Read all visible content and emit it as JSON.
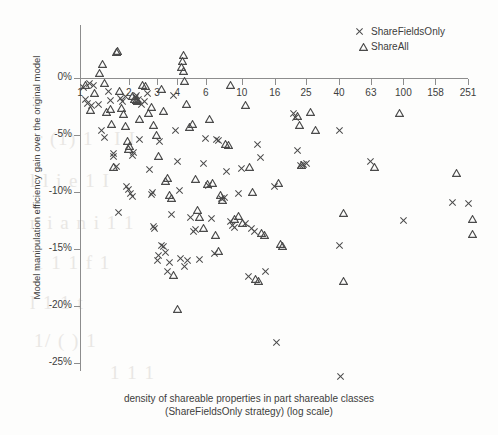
{
  "chart_data": {
    "type": "scatter",
    "title": "",
    "xlabel": "density of shareable properties in part shareable classes (ShareFieldsOnly strategy)  (log scale)",
    "ylabel": "Model manipulation efficiency gain over the original model",
    "xscale": "log",
    "xlim": [
      1,
      251
    ],
    "ylim": [
      -0.275,
      0.03
    ],
    "grid": false,
    "legend_position": "top-right",
    "xticks": [
      1,
      2,
      3,
      4,
      6,
      10,
      16,
      25,
      40,
      63,
      100,
      158,
      251
    ],
    "xtick_labels": [
      "1",
      "2",
      "3",
      "4",
      "6",
      "10",
      "16",
      "25",
      "40",
      "63",
      "100",
      "158",
      "251"
    ],
    "yticks": [
      0,
      -5,
      -10,
      -15,
      -20,
      -25
    ],
    "ytick_labels": [
      "0%",
      "-5%",
      "-10%",
      "-15%",
      "-20%",
      "-25%"
    ],
    "series": [
      {
        "name": "ShareFieldsOnly",
        "marker": "x",
        "color": "#4a4a4a",
        "points": [
          [
            1.05,
            -0.8
          ],
          [
            1.08,
            -1.9
          ],
          [
            1.12,
            -2.2
          ],
          [
            1.15,
            -0.5
          ],
          [
            1.18,
            -2.4
          ],
          [
            1.22,
            -0.7
          ],
          [
            1.3,
            -2.3
          ],
          [
            1.35,
            -4.6
          ],
          [
            1.42,
            -5.2
          ],
          [
            1.5,
            -1.2
          ],
          [
            1.55,
            -2.0
          ],
          [
            1.6,
            -6.6
          ],
          [
            1.62,
            -6.9
          ],
          [
            1.68,
            -7.8
          ],
          [
            1.72,
            -11.8
          ],
          [
            1.78,
            -1.8
          ],
          [
            1.82,
            -2.1
          ],
          [
            1.9,
            -1.6
          ],
          [
            1.95,
            -9.5
          ],
          [
            2.0,
            -9.8
          ],
          [
            2.05,
            -10.1
          ],
          [
            2.1,
            -10.4
          ],
          [
            2.12,
            -6.8
          ],
          [
            2.15,
            -6.5
          ],
          [
            2.2,
            -1.7
          ],
          [
            2.25,
            -1.5
          ],
          [
            2.3,
            -1.9
          ],
          [
            2.35,
            -5.4
          ],
          [
            2.4,
            -2.3
          ],
          [
            2.5,
            -2.1
          ],
          [
            2.6,
            -1.4
          ],
          [
            2.7,
            -8.0
          ],
          [
            2.75,
            -10.2
          ],
          [
            2.8,
            -10.0
          ],
          [
            2.85,
            -13.0
          ],
          [
            2.9,
            -13.2
          ],
          [
            3.0,
            -16.0
          ],
          [
            3.05,
            -15.6
          ],
          [
            3.1,
            -5.6
          ],
          [
            3.2,
            -14.7
          ],
          [
            3.3,
            -14.8
          ],
          [
            3.4,
            -15.3
          ],
          [
            3.5,
            -17.0
          ],
          [
            3.6,
            -16.2
          ],
          [
            3.7,
            -12.0
          ],
          [
            3.8,
            -1.5
          ],
          [
            3.9,
            -4.6
          ],
          [
            4.0,
            -7.3
          ],
          [
            4.1,
            -9.9
          ],
          [
            4.2,
            -15.8
          ],
          [
            4.4,
            -16.5
          ],
          [
            4.6,
            -16.0
          ],
          [
            4.8,
            -12.2
          ],
          [
            5.0,
            -13.5
          ],
          [
            5.2,
            -13.3
          ],
          [
            5.5,
            -15.9
          ],
          [
            5.8,
            -7.5
          ],
          [
            6.0,
            -5.3
          ],
          [
            6.2,
            -9.4
          ],
          [
            6.5,
            -12.3
          ],
          [
            6.8,
            -15.4
          ],
          [
            7.0,
            -5.4
          ],
          [
            7.2,
            -5.5
          ],
          [
            7.5,
            -10.6
          ],
          [
            7.8,
            -10.5
          ],
          [
            8.0,
            -8.2
          ],
          [
            8.5,
            -12.6
          ],
          [
            8.8,
            -12.9
          ],
          [
            9.0,
            -13.1
          ],
          [
            9.5,
            -10.1
          ],
          [
            10.0,
            -7.9
          ],
          [
            10.5,
            -12.8
          ],
          [
            11.0,
            -17.4
          ],
          [
            11.5,
            -13.2
          ],
          [
            12.0,
            -13.5
          ],
          [
            12.5,
            -5.8
          ],
          [
            13.0,
            -7.0
          ],
          [
            14.0,
            -17.0
          ],
          [
            16.0,
            -9.5
          ],
          [
            16.5,
            -23.2
          ],
          [
            21.0,
            -3.1
          ],
          [
            21.5,
            -3.5
          ],
          [
            22.0,
            -6.4
          ],
          [
            23.0,
            -7.7
          ],
          [
            24.0,
            -7.6
          ],
          [
            25.0,
            -7.5
          ],
          [
            40.0,
            -4.6
          ],
          [
            40.5,
            -14.7
          ],
          [
            41.0,
            -26.2
          ],
          [
            63.0,
            -7.3
          ],
          [
            100.0,
            -12.5
          ],
          [
            200.0,
            -10.9
          ],
          [
            251.0,
            -11.0
          ]
        ]
      },
      {
        "name": "ShareAll",
        "marker": "triangle",
        "color": "#4a4a4a",
        "points": [
          [
            1.02,
            -0.6
          ],
          [
            1.1,
            -2.8
          ],
          [
            1.16,
            -1.3
          ],
          [
            1.25,
            0.4
          ],
          [
            1.3,
            1.2
          ],
          [
            1.33,
            -0.4
          ],
          [
            1.38,
            -3.0
          ],
          [
            1.45,
            -2.7
          ],
          [
            1.48,
            -4.0
          ],
          [
            1.52,
            -7.8
          ],
          [
            1.58,
            2.3
          ],
          [
            1.6,
            2.4
          ],
          [
            1.65,
            -1.1
          ],
          [
            1.7,
            -2.6
          ],
          [
            1.75,
            -3.2
          ],
          [
            1.8,
            -4.2
          ],
          [
            1.85,
            -5.5
          ],
          [
            1.88,
            -6.2
          ],
          [
            1.92,
            -6.0
          ],
          [
            2.0,
            -1.6
          ],
          [
            2.05,
            -1.8
          ],
          [
            2.1,
            -1.9
          ],
          [
            2.15,
            -2.0
          ],
          [
            2.2,
            -3.6
          ],
          [
            2.3,
            -0.6
          ],
          [
            2.4,
            -0.7
          ],
          [
            2.5,
            -3.1
          ],
          [
            2.6,
            -2.5
          ],
          [
            2.7,
            -4.1
          ],
          [
            2.8,
            -5.0
          ],
          [
            2.9,
            -6.8
          ],
          [
            3.0,
            -1.0
          ],
          [
            3.1,
            -2.9
          ],
          [
            3.2,
            -9.0
          ],
          [
            3.3,
            -8.8
          ],
          [
            3.4,
            -10.3
          ],
          [
            3.5,
            -10.5
          ],
          [
            3.6,
            -17.3
          ],
          [
            3.8,
            -20.3
          ],
          [
            4.0,
            1.0
          ],
          [
            4.05,
            1.5
          ],
          [
            4.1,
            2.0
          ],
          [
            4.15,
            0.6
          ],
          [
            4.2,
            -0.3
          ],
          [
            4.3,
            -2.3
          ],
          [
            4.5,
            -4.3
          ],
          [
            4.7,
            -4.0
          ],
          [
            4.9,
            -8.9
          ],
          [
            5.0,
            -11.6
          ],
          [
            5.2,
            -12.2
          ],
          [
            5.5,
            -13.2
          ],
          [
            5.8,
            -9.3
          ],
          [
            6.0,
            -3.6
          ],
          [
            6.2,
            -9.2
          ],
          [
            6.5,
            -13.8
          ],
          [
            6.8,
            -15.2
          ],
          [
            7.0,
            -10.3
          ],
          [
            7.2,
            -10.7
          ],
          [
            7.5,
            -5.8
          ],
          [
            7.8,
            -5.9
          ],
          [
            8.0,
            -0.6
          ],
          [
            8.5,
            -12.4
          ],
          [
            9.0,
            -12.1
          ],
          [
            9.5,
            -12.7
          ],
          [
            10.0,
            -2.4
          ],
          [
            10.5,
            -7.8
          ],
          [
            11.0,
            -10.0
          ],
          [
            11.5,
            -17.6
          ],
          [
            12.0,
            -17.8
          ],
          [
            12.5,
            -13.6
          ],
          [
            13.0,
            -13.8
          ],
          [
            16.0,
            -9.2
          ],
          [
            16.5,
            -14.6
          ],
          [
            17.0,
            -14.7
          ],
          [
            21.0,
            -3.3
          ],
          [
            21.5,
            -4.1
          ],
          [
            22.0,
            -7.6
          ],
          [
            25.0,
            -3.0
          ],
          [
            27.0,
            -4.6
          ],
          [
            40.0,
            -11.8
          ],
          [
            40.5,
            -17.8
          ],
          [
            63.0,
            -7.8
          ],
          [
            90.0,
            -3.1
          ],
          [
            200.0,
            -8.3
          ],
          [
            251.0,
            -12.4
          ],
          [
            251.0,
            -13.7
          ]
        ]
      }
    ]
  },
  "legend": {
    "items": [
      {
        "label": "ShareFieldsOnly",
        "marker": "cross-marker"
      },
      {
        "label": "ShareAll",
        "marker": "triangle-marker"
      }
    ]
  },
  "axes": {
    "y_title": "Model manipulation efficiency gain over the original model",
    "x_caption_line1": "density of shareable properties in part shareable classes",
    "x_caption_line2": "(ShareFieldsOnly strategy)  (log scale)"
  },
  "background_artifacts": [
    {
      "text": "r (1) 1 · I I",
      "x": 36,
      "y": 128
    },
    {
      "text": "l l j e  1  I",
      "x": 30,
      "y": 170
    },
    {
      "text": "n i a n i 1 1",
      "x": 30,
      "y": 212
    },
    {
      "text": "1 1 1  f 1",
      "x": 34,
      "y": 252
    },
    {
      "text": "l 1 1 t",
      "x": 30,
      "y": 292
    },
    {
      "text": "1/ ( ) 1",
      "x": 34,
      "y": 330
    },
    {
      "text": "1 1 1",
      "x": 110,
      "y": 362
    }
  ],
  "colors": {
    "axis": "#8d8d8d",
    "marker": "#4a4a4a",
    "text": "#3d3d3d",
    "background": "#fdfdfc",
    "bleed_through": "#e9e7e4"
  }
}
